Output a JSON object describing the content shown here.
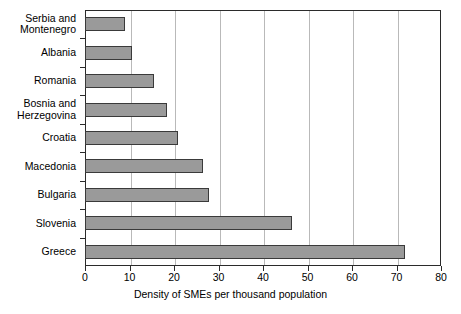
{
  "chart_data": {
    "type": "bar",
    "orientation": "horizontal",
    "title": "",
    "xlabel": "Density of SMEs per thousand population",
    "ylabel": "",
    "xlim": [
      0,
      80
    ],
    "xticks": [
      0,
      10,
      20,
      30,
      40,
      50,
      60,
      70,
      80
    ],
    "grid": "vertical",
    "legend": "none",
    "bar_color": "#9a9a9a",
    "bar_edge_color": "#3a3a3a",
    "categories": [
      "Serbia and\nMontenegro",
      "Albania",
      "Romania",
      "Bosnia and\nHerzegovina",
      "Croatia",
      "Macedonia",
      "Bulgaria",
      "Slovenia",
      "Greece"
    ],
    "values": [
      9,
      10.5,
      15.5,
      18.5,
      21,
      26.5,
      27.8,
      46.5,
      72
    ]
  }
}
